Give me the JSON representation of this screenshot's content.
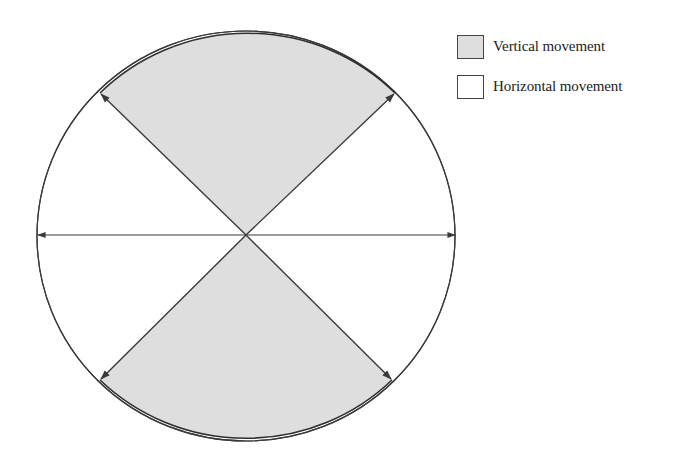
{
  "diagram": {
    "type": "sector-circle",
    "colors": {
      "vertical_fill": "#dedede",
      "horizontal_fill": "#ffffff",
      "stroke": "#3a3a3a"
    },
    "sectors": [
      {
        "position": "top",
        "category": "vertical",
        "shaded": true
      },
      {
        "position": "right",
        "category": "horizontal",
        "shaded": false
      },
      {
        "position": "bottom",
        "category": "vertical",
        "shaded": true
      },
      {
        "position": "left",
        "category": "horizontal",
        "shaded": false
      }
    ],
    "arrows": [
      {
        "direction": "up-left"
      },
      {
        "direction": "up-right"
      },
      {
        "direction": "down-left"
      },
      {
        "direction": "down-right"
      },
      {
        "direction": "left"
      },
      {
        "direction": "right"
      }
    ]
  },
  "legend": {
    "items": [
      {
        "label": "Vertical movement",
        "color": "#dedede"
      },
      {
        "label": "Horizontal movement",
        "color": "#ffffff"
      }
    ]
  }
}
